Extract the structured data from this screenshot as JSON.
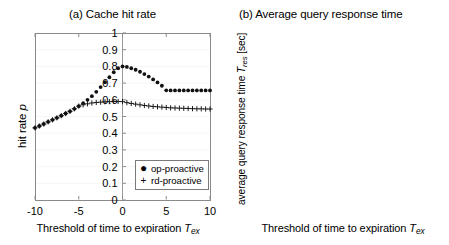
{
  "figure": {
    "panels": [
      {
        "id": "a",
        "title": "(a) Cache hit rate",
        "ylabel_main": "hit rate",
        "ylabel_italic": "p",
        "ylabel_sub": "",
        "ylabel_unit": "",
        "xlabel_main": "Threshold of time to expiration",
        "xlabel_italic": "T",
        "xlabel_sub": "ex",
        "legend": [
          {
            "marker": "filled-circle",
            "label": "op-proactive"
          },
          {
            "marker": "plus",
            "label": "rd-proactive"
          }
        ]
      },
      {
        "id": "b",
        "title": "(b) Average query response time",
        "ylabel_main": "average query response time",
        "ylabel_italic": "T",
        "ylabel_sub": "res",
        "ylabel_unit": "[sec]",
        "xlabel_main": "Threshold of time to expiration",
        "xlabel_italic": "T",
        "xlabel_sub": "ex",
        "legend": [
          {
            "marker": "filled-circle",
            "label": "op-proactive"
          },
          {
            "marker": "plus",
            "label": "rd-proactive"
          }
        ]
      }
    ]
  },
  "chart_data": [
    {
      "type": "scatter",
      "title": "(a) Cache hit rate",
      "xlabel": "Threshold of time to expiration T_ex",
      "ylabel": "hit rate p",
      "xlim": [
        -10,
        10
      ],
      "ylim": [
        0,
        1
      ],
      "xticks": [
        -10,
        -5,
        0,
        5,
        10
      ],
      "xticklabels": [
        "-10",
        "-5",
        "0",
        "5",
        "10"
      ],
      "yticks": [
        0,
        0.1,
        0.2,
        0.3,
        0.4,
        0.5,
        0.6,
        0.7,
        0.8,
        0.9,
        1
      ],
      "yticklabels": [
        "0",
        "0.1",
        "0.2",
        "0.3",
        "0.4",
        "0.5",
        "0.6",
        "0.7",
        "0.8",
        "0.9",
        "1"
      ],
      "grid": true,
      "legend_position": "lower-right",
      "x": [
        -10,
        -9.5,
        -9,
        -8.5,
        -8,
        -7.5,
        -7,
        -6.5,
        -6,
        -5.5,
        -5,
        -4.5,
        -4,
        -3.5,
        -3,
        -2.5,
        -2,
        -1.5,
        -1,
        -0.5,
        0,
        0.5,
        1,
        1.5,
        2,
        2.5,
        3,
        3.5,
        4,
        4.5,
        5,
        5.5,
        6,
        6.5,
        7,
        7.5,
        8,
        8.5,
        9,
        9.5,
        10
      ],
      "series": [
        {
          "name": "op-proactive",
          "marker": "filled-circle",
          "values": [
            0.432,
            0.443,
            0.455,
            0.468,
            0.48,
            0.492,
            0.505,
            0.518,
            0.531,
            0.546,
            0.562,
            0.58,
            0.6,
            0.622,
            0.648,
            0.676,
            0.705,
            0.735,
            0.765,
            0.789,
            0.8,
            0.797,
            0.789,
            0.78,
            0.768,
            0.754,
            0.739,
            0.722,
            0.704,
            0.684,
            0.657,
            0.656,
            0.656,
            0.656,
            0.656,
            0.656,
            0.656,
            0.656,
            0.656,
            0.656,
            0.656
          ]
        },
        {
          "name": "rd-proactive",
          "marker": "plus",
          "values": [
            0.432,
            0.443,
            0.455,
            0.468,
            0.48,
            0.492,
            0.505,
            0.518,
            0.531,
            0.546,
            0.562,
            0.57,
            0.576,
            0.581,
            0.584,
            0.586,
            0.588,
            0.589,
            0.59,
            0.59,
            0.589,
            0.583,
            0.578,
            0.574,
            0.57,
            0.566,
            0.563,
            0.56,
            0.558,
            0.556,
            0.554,
            0.552,
            0.551,
            0.55,
            0.549,
            0.548,
            0.547,
            0.546,
            0.546,
            0.545,
            0.545
          ]
        }
      ]
    },
    {
      "type": "scatter",
      "title": "(b) Average query response time",
      "xlabel": "Threshold of time to expiration T_ex",
      "ylabel": "average query response time T_res [sec]",
      "xlim": [
        -10,
        10
      ],
      "ylim": [
        0,
        0.7
      ],
      "xticks": [
        -10,
        -5,
        0,
        5,
        10
      ],
      "xticklabels": [
        "-10",
        "-5",
        "0",
        "5",
        "10"
      ],
      "yticks": [
        0,
        0.1,
        0.2,
        0.3,
        0.4,
        0.5,
        0.6,
        0.7
      ],
      "yticklabels": [
        "0",
        "0.1",
        "0.2",
        "0.3",
        "0.4",
        "0.5",
        "0.6",
        "0.7"
      ],
      "grid": true,
      "legend_position": "lower-right",
      "x": [
        -10,
        -9.5,
        -9,
        -8.5,
        -8,
        -7.5,
        -7,
        -6.5,
        -6,
        -5.5,
        -5,
        -4.5,
        -4,
        -3.5,
        -3,
        -2.5,
        -2,
        -1.5,
        -1,
        -0.5,
        0,
        0.5,
        1,
        1.5,
        2,
        2.5,
        3,
        3.5,
        4,
        4.5,
        5,
        5.5,
        6,
        6.5,
        7,
        7.5,
        8,
        8.5,
        9,
        9.5,
        10
      ],
      "series": [
        {
          "name": "op-proactive",
          "marker": "filled-circle",
          "values": [
            0.625,
            0.616,
            0.606,
            0.596,
            0.586,
            0.575,
            0.563,
            0.551,
            0.538,
            0.525,
            0.47,
            0.452,
            0.428,
            0.408,
            0.388,
            0.366,
            0.34,
            0.312,
            0.288,
            0.262,
            0.222,
            0.24,
            0.258,
            0.272,
            0.288,
            0.3,
            0.314,
            0.33,
            0.348,
            0.362,
            0.38,
            0.38,
            0.38,
            0.38,
            0.38,
            0.38,
            0.38,
            0.38,
            0.38,
            0.38,
            0.38
          ]
        },
        {
          "name": "rd-proactive",
          "marker": "plus",
          "values": [
            0.625,
            0.616,
            0.606,
            0.596,
            0.586,
            0.575,
            0.563,
            0.551,
            0.538,
            0.525,
            0.47,
            0.467,
            0.465,
            0.464,
            0.463,
            0.462,
            0.461,
            0.459,
            0.457,
            0.456,
            0.455,
            0.459,
            0.463,
            0.467,
            0.47,
            0.474,
            0.477,
            0.48,
            0.483,
            0.486,
            0.491,
            0.492,
            0.493,
            0.494,
            0.494,
            0.495,
            0.495,
            0.495,
            0.495,
            0.495,
            0.494
          ]
        }
      ]
    }
  ]
}
